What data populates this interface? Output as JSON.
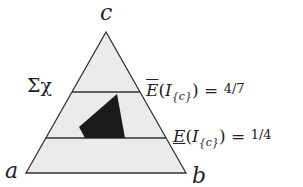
{
  "diagram": {
    "type": "probability-simplex",
    "vertices": {
      "top": "c",
      "bottom_left": "a",
      "bottom_right": "b"
    },
    "set_label": "Σχ",
    "upper_line": {
      "operator": "E",
      "decoration": "overline",
      "argument": "I",
      "subscript": "{c}",
      "equals": "=",
      "value": "4/7"
    },
    "lower_line": {
      "operator": "E",
      "decoration": "underline",
      "argument": "I",
      "subscript": "{c}",
      "equals": "=",
      "value": "1/4"
    },
    "colors": {
      "triangle_fill": "#ebebeb",
      "stroke": "#333333",
      "credal_set_fill": "#1a1a1a"
    }
  }
}
